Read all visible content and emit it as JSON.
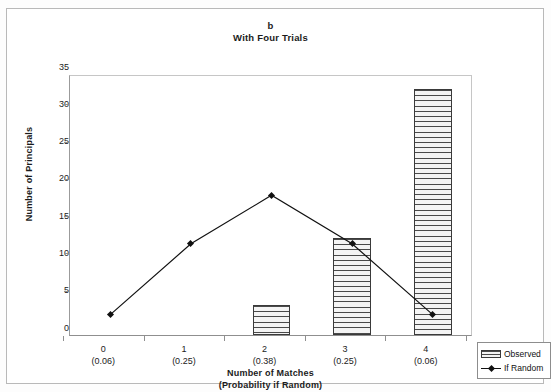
{
  "figure": {
    "title_label": "b",
    "subtitle_label": "With Four Trials"
  },
  "legend": {
    "position": "bottom-right",
    "items": [
      {
        "label": "Observed",
        "marker": "hatched-bar-swatch"
      },
      {
        "label": "If Random",
        "marker": "line-diamond-swatch"
      }
    ]
  },
  "axes": {
    "y_title": "Number of Principals",
    "x_title_line1": "Number of Matches",
    "x_title_line2": "(Probability if Random)",
    "y_ticks": [
      "0",
      "5",
      "10",
      "15",
      "20",
      "25",
      "30",
      "35"
    ],
    "x_tick_labels": [
      {
        "match": "0",
        "prob": "(0.06)"
      },
      {
        "match": "1",
        "prob": "(0.25)"
      },
      {
        "match": "2",
        "prob": "(0.38)"
      },
      {
        "match": "3",
        "prob": "(0.25)"
      },
      {
        "match": "4",
        "prob": "(0.06)"
      }
    ]
  },
  "chart_data": {
    "type": "bar",
    "title": "b\nWith Four Trials",
    "xlabel": "Number of Matches (Probability if Random)",
    "ylabel": "Number of Principals",
    "categories": [
      "0",
      "1",
      "2",
      "3",
      "4"
    ],
    "category_sublabels": [
      "(0.06)",
      "(0.25)",
      "(0.38)",
      "(0.25)",
      "(0.06)"
    ],
    "ylim": [
      0,
      35
    ],
    "ytick_step": 5,
    "grid": false,
    "legend_position": "bottom-right",
    "series": [
      {
        "name": "Observed",
        "type": "bar",
        "values": [
          0,
          0,
          4,
          13,
          33
        ]
      },
      {
        "name": "If Random",
        "type": "line",
        "values": [
          3,
          12.5,
          19,
          12.5,
          3
        ]
      }
    ]
  },
  "colors": {
    "bar_outline": "#3a3a3a",
    "bar_fill": "#f2f2f2",
    "line": "#111111",
    "axis": "#8f8f8f",
    "frame": "#b9b9b9"
  }
}
